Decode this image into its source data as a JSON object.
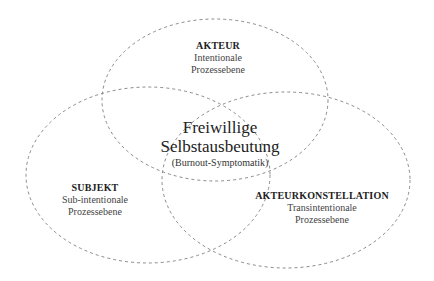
{
  "diagram": {
    "type": "venn",
    "style": {
      "stroke": "#8a8a8a",
      "stroke_dash": "3 3",
      "background": "#ffffff"
    },
    "circles": [
      {
        "id": "akteur",
        "title": "AKTEUR",
        "line1": "Intentionale",
        "line2": "Prozessebene",
        "ellipse": {
          "cx": 215,
          "cy": 100,
          "rx": 113,
          "ry": 81
        }
      },
      {
        "id": "subjekt",
        "title": "SUBJEKT",
        "line1": "Sub-intentionale",
        "line2": "Prozessebene",
        "ellipse": {
          "cx": 148,
          "cy": 175,
          "rx": 122,
          "ry": 88
        }
      },
      {
        "id": "akteurkonstellation",
        "title": "AKTEURKONSTELLATION",
        "line1": "Transintentionale",
        "line2": "Prozessebene",
        "ellipse": {
          "cx": 286,
          "cy": 180,
          "rx": 124,
          "ry": 88
        }
      }
    ],
    "center": {
      "line1": "Freiwillige",
      "line2": "Selbstausbeutung",
      "line3": "(Burnout-Symptomatik)"
    }
  }
}
